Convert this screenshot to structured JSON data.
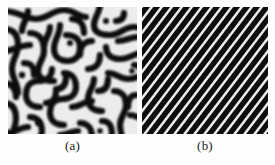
{
  "figure": {
    "background_color": "#fefefe",
    "panels": [
      {
        "id": "a",
        "caption": "(a)",
        "pattern_name": "labyrinthine-pattern",
        "description": "maze-like interconnected stripe domains",
        "foreground_color": "#0b0b0b",
        "background_color": "#e9e9e9",
        "stripe_width_px": 6
      },
      {
        "id": "b",
        "caption": "(b)",
        "pattern_name": "diagonal-stripe-pattern",
        "description": "parallel diagonal stripes oriented lower-left to upper-right",
        "foreground_color": "#0b0b0b",
        "background_color": "#e9e9e9",
        "stripe_angle_deg": 52,
        "stripe_period_px": 10,
        "stripe_count": 26
      }
    ]
  }
}
